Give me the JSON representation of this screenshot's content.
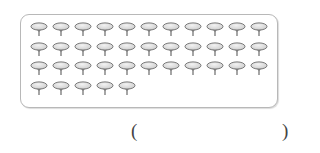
{
  "figure": {
    "rows": [
      11,
      11,
      11,
      5
    ],
    "total_pins": 38,
    "pin_icon": "thumbtack-icon",
    "colors": {
      "pin_head": "#cfcfcf",
      "pin_outline": "#6a6a6a",
      "box_border": "#b8b8b8"
    }
  },
  "answer": {
    "open_paren": "(",
    "value": "",
    "close_paren": ")"
  }
}
